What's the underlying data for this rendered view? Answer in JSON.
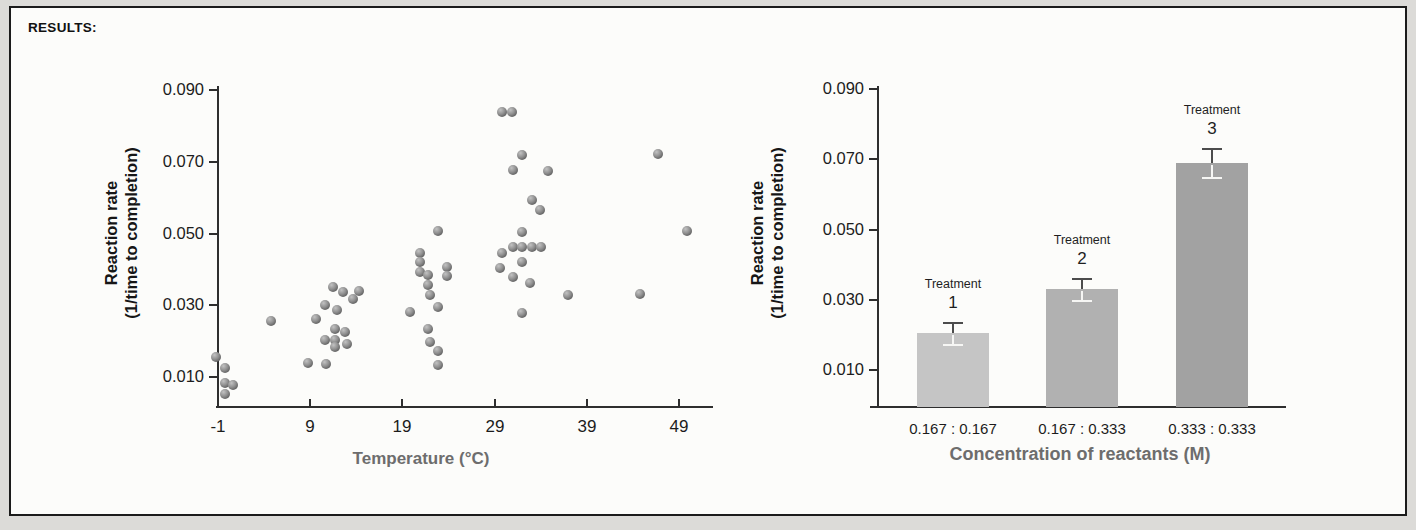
{
  "header": {
    "results_label": "RESULTS:"
  },
  "colors": {
    "page_background": "#dcdbd8",
    "panel_background": "#fcfcfa",
    "panel_border": "#1b1b1b",
    "axis": "#2e2e2e",
    "tick_label": "#1c1c1c",
    "axis_title_gray": "#6d6d6d",
    "point_fill": "#8f8f8f",
    "point_highlight": "#c2c2c2",
    "point_shadow": "#5a5a5a",
    "error_bar_dark": "#4c4c4c",
    "error_bar_light": "#f6f6f4",
    "bar_fills": [
      "#c5c5c5",
      "#b1b1b1",
      "#a2a2a2"
    ]
  },
  "chart_data": [
    {
      "type": "scatter",
      "title": "",
      "xlabel": "Temperature (°C)",
      "ylabel_lines": [
        "Reaction rate",
        "(1/time to completion)"
      ],
      "x_ticks": [
        -1,
        9,
        19,
        29,
        39,
        49
      ],
      "y_ticks": [
        "0.010",
        "0.030",
        "0.050",
        "0.070",
        "0.090"
      ],
      "xlim": [
        -1,
        52.5
      ],
      "ylim": [
        0.001,
        0.093
      ],
      "grid": false,
      "legend": false,
      "points": [
        [
          -1.2,
          0.0157
        ],
        [
          -0.2,
          0.0125
        ],
        [
          -0.3,
          0.0083
        ],
        [
          0.6,
          0.0078
        ],
        [
          -0.2,
          0.0053
        ],
        [
          4.7,
          0.0256
        ],
        [
          11.5,
          0.0351
        ],
        [
          14.3,
          0.0341
        ],
        [
          12.6,
          0.0337
        ],
        [
          13.6,
          0.0318
        ],
        [
          10.6,
          0.0301
        ],
        [
          11.9,
          0.0287
        ],
        [
          9.6,
          0.0262
        ],
        [
          11.7,
          0.0234
        ],
        [
          12.8,
          0.0226
        ],
        [
          10.6,
          0.0203
        ],
        [
          11.7,
          0.0203
        ],
        [
          13.0,
          0.0192
        ],
        [
          11.7,
          0.0184
        ],
        [
          8.8,
          0.0139
        ],
        [
          10.7,
          0.0136
        ],
        [
          22.9,
          0.0507
        ],
        [
          20.9,
          0.0446
        ],
        [
          20.9,
          0.0421
        ],
        [
          23.8,
          0.0407
        ],
        [
          20.9,
          0.0393
        ],
        [
          21.8,
          0.0385
        ],
        [
          23.8,
          0.0381
        ],
        [
          21.8,
          0.0357
        ],
        [
          22.0,
          0.0329
        ],
        [
          22.9,
          0.0296
        ],
        [
          19.8,
          0.0282
        ],
        [
          21.8,
          0.0234
        ],
        [
          22.0,
          0.0198
        ],
        [
          22.9,
          0.0173
        ],
        [
          22.9,
          0.0134
        ],
        [
          29.8,
          0.0839
        ],
        [
          30.9,
          0.0839
        ],
        [
          32.0,
          0.0719
        ],
        [
          31.0,
          0.0678
        ],
        [
          34.8,
          0.0675
        ],
        [
          33.0,
          0.0594
        ],
        [
          33.9,
          0.0566
        ],
        [
          32.0,
          0.0504
        ],
        [
          31.0,
          0.0463
        ],
        [
          32.0,
          0.0463
        ],
        [
          33.0,
          0.0463
        ],
        [
          34.0,
          0.0463
        ],
        [
          29.8,
          0.0446
        ],
        [
          32.0,
          0.0421
        ],
        [
          29.6,
          0.0404
        ],
        [
          31.0,
          0.0379
        ],
        [
          32.8,
          0.0362
        ],
        [
          32.0,
          0.0279
        ],
        [
          37.0,
          0.0329
        ],
        [
          44.8,
          0.0332
        ],
        [
          46.7,
          0.0722
        ],
        [
          49.9,
          0.0507
        ]
      ]
    },
    {
      "type": "bar",
      "title": "",
      "xlabel": "Concentration of reactants (M)",
      "ylabel_lines": [
        "Reaction rate",
        "(1/time to completion)"
      ],
      "y_ticks": [
        "0.010",
        "0.030",
        "0.050",
        "0.070",
        "0.090"
      ],
      "ylim": [
        0,
        0.093
      ],
      "grid": false,
      "legend": false,
      "categories": [
        "0.167 : 0.167",
        "0.167 : 0.333",
        "0.333 : 0.333"
      ],
      "bars": [
        {
          "treatment_word": "Treatment",
          "treatment_number": "1",
          "category": "0.167 : 0.167",
          "value": 0.0205,
          "error": 0.003
        },
        {
          "treatment_word": "Treatment",
          "treatment_number": "2",
          "category": "0.167 : 0.333",
          "value": 0.033,
          "error": 0.003
        },
        {
          "treatment_word": "Treatment",
          "treatment_number": "3",
          "category": "0.333 : 0.333",
          "value": 0.069,
          "error": 0.004
        }
      ]
    }
  ]
}
